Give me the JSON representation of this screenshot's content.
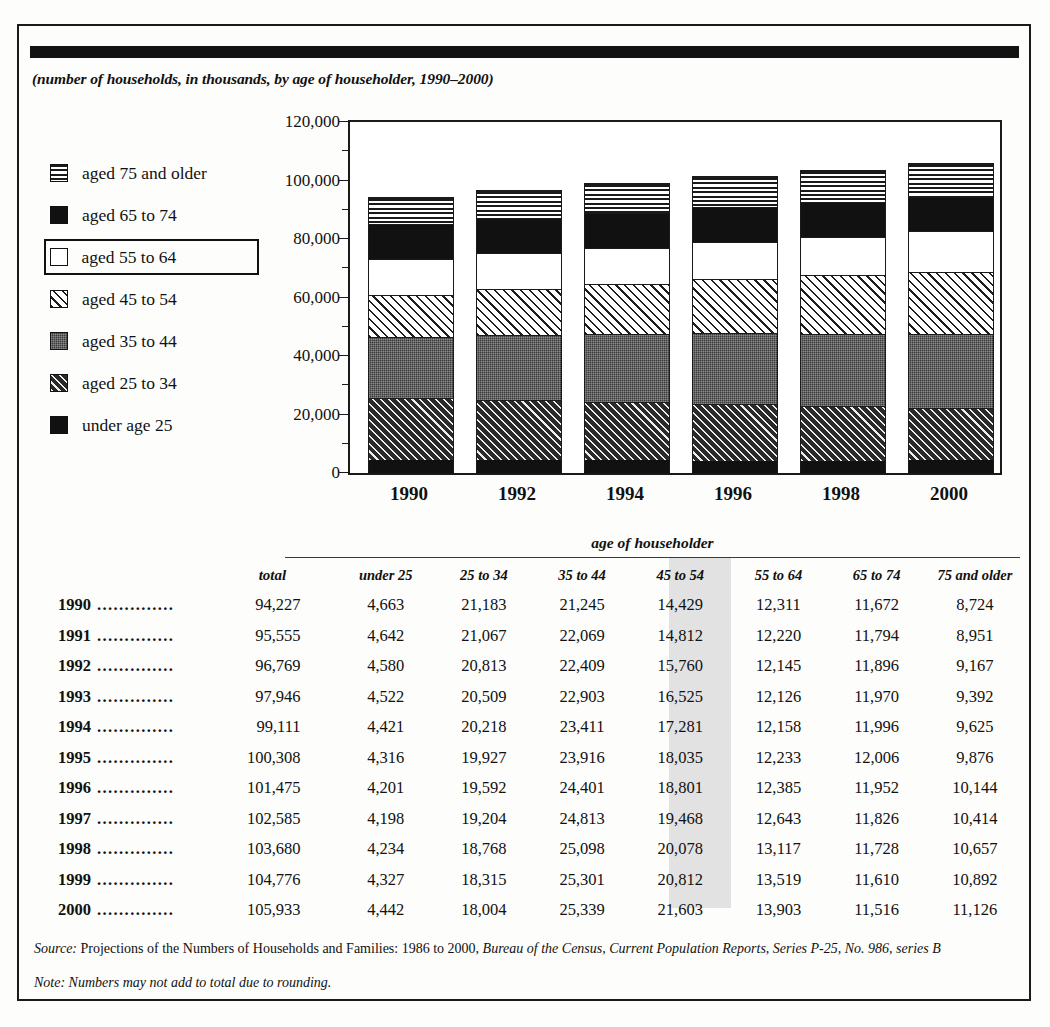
{
  "subtitle": "(number of households, in thousands, by age of householder, 1990–2000)",
  "legend": {
    "items": [
      {
        "label": "aged 75 and older",
        "pattern": "horizontal-lines",
        "boxed": false
      },
      {
        "label": "aged 65 to 74",
        "pattern": "solid-black",
        "boxed": false
      },
      {
        "label": "aged 55 to 64",
        "pattern": "white",
        "boxed": true
      },
      {
        "label": "aged 45 to 54",
        "pattern": "light-diagonal-hatch",
        "boxed": false
      },
      {
        "label": "aged 35 to 44",
        "pattern": "dark-grey-stipple",
        "boxed": false
      },
      {
        "label": "aged 25 to 34",
        "pattern": "dark-diagonal-hatch",
        "boxed": false
      },
      {
        "label": "under age 25",
        "pattern": "solid-black",
        "boxed": false
      }
    ]
  },
  "chart_data": {
    "type": "bar",
    "subtype": "stacked",
    "title": "",
    "xlabel": "",
    "ylabel": "",
    "ylim": [
      0,
      120000
    ],
    "ytick_labels": [
      "0",
      "20,000",
      "40,000",
      "60,000",
      "80,000",
      "100,000",
      "120,000"
    ],
    "ytick_values": [
      0,
      20000,
      40000,
      60000,
      80000,
      100000,
      120000
    ],
    "yminor_values": [
      10000,
      30000,
      50000,
      70000,
      90000,
      110000
    ],
    "grid": false,
    "legend_position": "left",
    "categories": [
      "1990",
      "1992",
      "1994",
      "1996",
      "1998",
      "2000"
    ],
    "series": [
      {
        "name": "under age 25",
        "pattern": "solid-black",
        "values": [
          4663,
          4580,
          4421,
          4201,
          4234,
          4442
        ]
      },
      {
        "name": "aged 25 to 34",
        "pattern": "dark-diagonal-hatch",
        "values": [
          21183,
          20813,
          20218,
          19592,
          18768,
          18004
        ]
      },
      {
        "name": "aged 35 to 44",
        "pattern": "dark-grey-stipple",
        "values": [
          21245,
          22409,
          23411,
          24401,
          25098,
          25339
        ]
      },
      {
        "name": "aged 45 to 54",
        "pattern": "light-diagonal-hatch",
        "values": [
          14429,
          15760,
          17281,
          18801,
          20078,
          21603
        ]
      },
      {
        "name": "aged 55 to 64",
        "pattern": "white",
        "values": [
          12311,
          12145,
          12158,
          12385,
          13117,
          13903
        ]
      },
      {
        "name": "aged 65 to 74",
        "pattern": "solid-black",
        "values": [
          11672,
          11896,
          11996,
          11952,
          11728,
          11516
        ]
      },
      {
        "name": "aged 75 and older",
        "pattern": "horizontal-lines",
        "values": [
          8724,
          9167,
          9625,
          10144,
          10657,
          11126
        ]
      }
    ],
    "totals": [
      94227,
      96769,
      99111,
      101475,
      103680,
      105933
    ]
  },
  "table": {
    "group_header": "age of householder",
    "headers": {
      "year": "",
      "total": "total",
      "ages": [
        "under 25",
        "25 to 34",
        "35 to 44",
        "45 to 54",
        "55 to 64",
        "65 to 74",
        "75 and older"
      ]
    },
    "highlight_column": "55 to 64",
    "highlight_color": "#e2e2e2",
    "dots": "..............",
    "rows": [
      {
        "year": "1990",
        "total": "94,227",
        "cells": [
          "4,663",
          "21,183",
          "21,245",
          "14,429",
          "12,311",
          "11,672",
          "8,724"
        ]
      },
      {
        "year": "1991",
        "total": "95,555",
        "cells": [
          "4,642",
          "21,067",
          "22,069",
          "14,812",
          "12,220",
          "11,794",
          "8,951"
        ]
      },
      {
        "year": "1992",
        "total": "96,769",
        "cells": [
          "4,580",
          "20,813",
          "22,409",
          "15,760",
          "12,145",
          "11,896",
          "9,167"
        ]
      },
      {
        "year": "1993",
        "total": "97,946",
        "cells": [
          "4,522",
          "20,509",
          "22,903",
          "16,525",
          "12,126",
          "11,970",
          "9,392"
        ]
      },
      {
        "year": "1994",
        "total": "99,111",
        "cells": [
          "4,421",
          "20,218",
          "23,411",
          "17,281",
          "12,158",
          "11,996",
          "9,625"
        ]
      },
      {
        "year": "1995",
        "total": "100,308",
        "cells": [
          "4,316",
          "19,927",
          "23,916",
          "18,035",
          "12,233",
          "12,006",
          "9,876"
        ]
      },
      {
        "year": "1996",
        "total": "101,475",
        "cells": [
          "4,201",
          "19,592",
          "24,401",
          "18,801",
          "12,385",
          "11,952",
          "10,144"
        ]
      },
      {
        "year": "1997",
        "total": "102,585",
        "cells": [
          "4,198",
          "19,204",
          "24,813",
          "19,468",
          "12,643",
          "11,826",
          "10,414"
        ]
      },
      {
        "year": "1998",
        "total": "103,680",
        "cells": [
          "4,234",
          "18,768",
          "25,098",
          "20,078",
          "13,117",
          "11,728",
          "10,657"
        ]
      },
      {
        "year": "1999",
        "total": "104,776",
        "cells": [
          "4,327",
          "18,315",
          "25,301",
          "20,812",
          "13,519",
          "11,610",
          "10,892"
        ]
      },
      {
        "year": "2000",
        "total": "105,933",
        "cells": [
          "4,442",
          "18,004",
          "25,339",
          "21,603",
          "13,903",
          "11,516",
          "11,126"
        ]
      }
    ]
  },
  "notes": {
    "source_lead": "Source:",
    "source_text": " Projections of the Numbers of Households and Families: 1986 to 2000, ",
    "source_italic": "Bureau of the Census, Current Population Reports, Series P-25, No. 986, series B",
    "note_text": "Note: Numbers may not add to total due to rounding."
  }
}
